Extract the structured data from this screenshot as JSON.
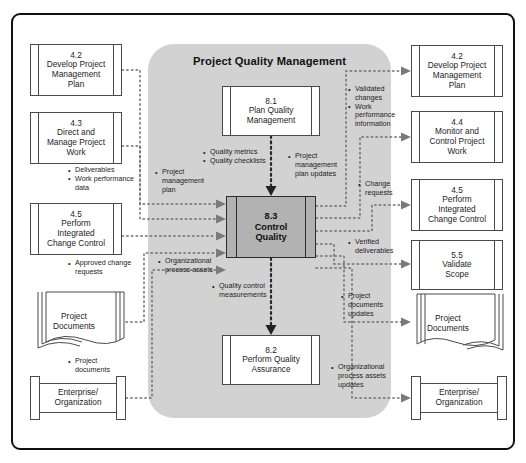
{
  "diagram": {
    "title": "Project Quality Management",
    "knowledge_area": "Project Quality Management",
    "type": "data-flow-diagram"
  },
  "center_process": {
    "number": "8.3",
    "name_line1": "Control",
    "name_line2": "Quality",
    "fill": "#b2b2b2"
  },
  "group_fill": "#d2d2d2",
  "internal_processes": [
    {
      "number": "8.1",
      "line1": "Plan Quality",
      "line2": "Management"
    },
    {
      "number": "8.2",
      "line1": "Perform Quality",
      "line2": "Assurance"
    }
  ],
  "inputs": {
    "nodes": [
      {
        "number": "4.2",
        "line1": "Develop Project",
        "line2": "Management",
        "line3": "Plan",
        "shape": "process"
      },
      {
        "number": "4.3",
        "line1": "Direct and",
        "line2": "Manage Project",
        "line3": "Work",
        "shape": "process"
      },
      {
        "number": "4.5",
        "line1": "Perform",
        "line2": "Integrated",
        "line3": "Change Control",
        "shape": "process"
      },
      {
        "line1": "Project",
        "line2": "Documents",
        "shape": "documents"
      },
      {
        "line1": "Enterprise/",
        "line2": "Organization",
        "shape": "enterprise"
      }
    ],
    "flows": [
      {
        "items": [
          "Deliverables",
          "Work performance data"
        ]
      },
      {
        "items": [
          "Approved change requests"
        ]
      },
      {
        "items": [
          "Project documents"
        ]
      },
      {
        "items": [
          "Project management plan"
        ]
      },
      {
        "items": [
          "Organizational process assets"
        ]
      }
    ]
  },
  "internal_flows": [
    {
      "items": [
        "Quality metrics",
        "Quality checklists"
      ]
    },
    {
      "items": [
        "Project management plan updates"
      ]
    },
    {
      "items": [
        "Quality control measurements"
      ]
    }
  ],
  "outputs": {
    "nodes": [
      {
        "number": "4.2",
        "line1": "Develop Project",
        "line2": "Management",
        "line3": "Plan",
        "shape": "process"
      },
      {
        "number": "4.4",
        "line1": "Monitor and",
        "line2": "Control Project",
        "line3": "Work",
        "shape": "process"
      },
      {
        "number": "4.5",
        "line1": "Perform",
        "line2": "Integrated",
        "line3": "Change Control",
        "shape": "process"
      },
      {
        "number": "5.5",
        "line1": "Validate",
        "line2": "Scope",
        "shape": "process"
      },
      {
        "line1": "Project",
        "line2": "Documents",
        "shape": "documents"
      },
      {
        "line1": "Enterprise/",
        "line2": "Organization",
        "shape": "enterprise"
      }
    ],
    "flows": [
      {
        "items": [
          "Validated changes",
          "Work performance information"
        ]
      },
      {
        "items": [
          "Change requests"
        ]
      },
      {
        "items": [
          "Verified deliverables"
        ]
      },
      {
        "items": [
          "Project documents updates"
        ]
      },
      {
        "items": [
          "Organizational process assets updates"
        ]
      }
    ]
  }
}
